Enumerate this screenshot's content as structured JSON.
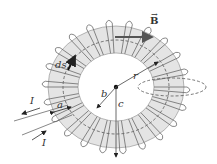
{
  "diagram": {
    "labels": {
      "B": "B",
      "ds": "ds",
      "r": "r",
      "b": "b",
      "c": "c",
      "a": "a",
      "I_out": "I",
      "I_in": "I"
    },
    "colors": {
      "toroid_fill": "#e4e4e4",
      "wire": "#6a6a6a",
      "text": "#333333",
      "arrow": "#111111"
    },
    "turns": 22
  }
}
